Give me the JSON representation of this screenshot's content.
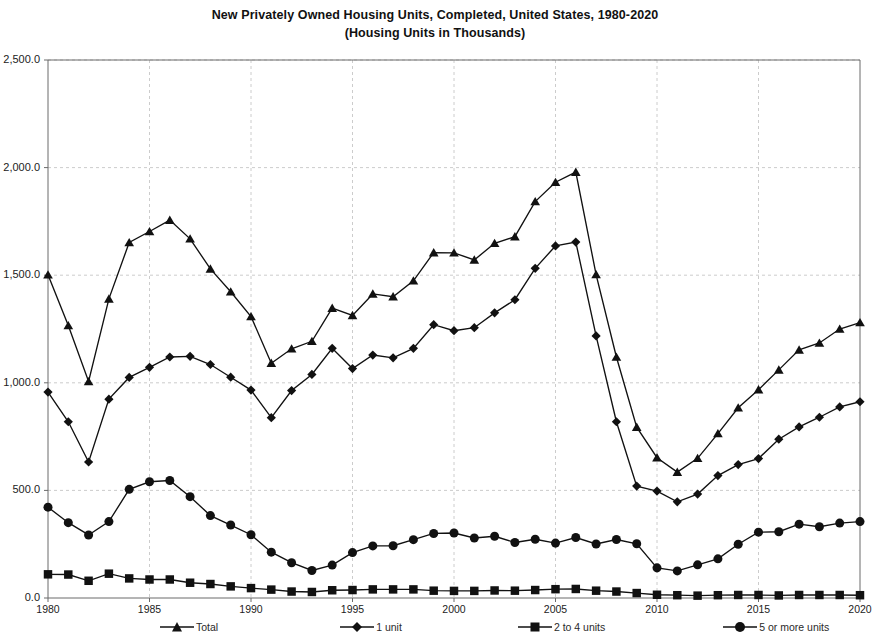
{
  "chart_data": {
    "type": "line",
    "title": "New Privately Owned Housing Units, Completed, United States, 1980-2020",
    "subtitle": "(Housing Units in Thousands)",
    "xlabel": "",
    "ylabel": "",
    "xlim": [
      1980,
      2020
    ],
    "ylim": [
      0,
      2500
    ],
    "grid": true,
    "legend_position": "bottom",
    "ytick_labels": [
      "2,500.0",
      "2,000.0",
      "1,500.0",
      "1,000.0",
      "500.0",
      "0.0"
    ],
    "ytick_values": [
      2500,
      2000,
      1500,
      1000,
      500,
      0
    ],
    "xtick_labels": [
      "1980",
      "1985",
      "1990",
      "1995",
      "2000",
      "2005",
      "2010",
      "2015",
      "2020"
    ],
    "xtick_values": [
      1980,
      1985,
      1990,
      1995,
      2000,
      2005,
      2010,
      2015,
      2020
    ],
    "x": [
      1980,
      1981,
      1982,
      1983,
      1984,
      1985,
      1986,
      1987,
      1988,
      1989,
      1990,
      1991,
      1992,
      1993,
      1994,
      1995,
      1996,
      1997,
      1998,
      1999,
      2000,
      2001,
      2002,
      2003,
      2004,
      2005,
      2006,
      2007,
      2008,
      2009,
      2010,
      2011,
      2012,
      2013,
      2014,
      2015,
      2016,
      2017,
      2018,
      2019,
      2020
    ],
    "series": [
      {
        "name": "Total",
        "marker": "triangle",
        "values": [
          1502,
          1266,
          1006,
          1390,
          1652,
          1703,
          1756,
          1669,
          1529,
          1423,
          1308,
          1091,
          1158,
          1193,
          1347,
          1313,
          1413,
          1400,
          1474,
          1605,
          1604,
          1571,
          1648,
          1679,
          1842,
          1932,
          1979,
          1503,
          1120,
          794,
          652,
          585,
          649,
          764,
          884,
          968,
          1060,
          1153,
          1185,
          1250,
          1280
        ]
      },
      {
        "name": "1 unit",
        "marker": "diamond",
        "values": [
          957,
          819,
          632,
          924,
          1025,
          1072,
          1120,
          1123,
          1085,
          1026,
          966,
          838,
          964,
          1039,
          1160,
          1066,
          1129,
          1116,
          1160,
          1270,
          1242,
          1256,
          1325,
          1386,
          1532,
          1636,
          1654,
          1218,
          819,
          520,
          497,
          447,
          483,
          569,
          620,
          648,
          738,
          795,
          840,
          888,
          912
        ]
      },
      {
        "name": "2 to 4 units",
        "marker": "square",
        "values": [
          110,
          109,
          80,
          113,
          91,
          86,
          86,
          71,
          65,
          54,
          46,
          39,
          30,
          28,
          36,
          37,
          40,
          40,
          40,
          34,
          33,
          33,
          35,
          34,
          37,
          41,
          42,
          34,
          30,
          23,
          15,
          13,
          11,
          13,
          14,
          14,
          12,
          14,
          14,
          14,
          13
        ]
      },
      {
        "name": "5 or more units",
        "marker": "circle",
        "values": [
          422,
          350,
          293,
          355,
          505,
          540,
          546,
          471,
          383,
          339,
          294,
          213,
          164,
          128,
          153,
          211,
          242,
          243,
          271,
          300,
          302,
          279,
          287,
          258,
          273,
          255,
          281,
          251,
          272,
          252,
          140,
          126,
          154,
          182,
          250,
          306,
          308,
          343,
          331,
          348,
          355
        ]
      }
    ]
  },
  "legend": {
    "items": [
      {
        "label": "Total",
        "marker": "triangle-marker-icon"
      },
      {
        "label": "1 unit",
        "marker": "diamond-marker-icon"
      },
      {
        "label": "2 to 4 units",
        "marker": "square-marker-icon"
      },
      {
        "label": "5 or more units",
        "marker": "circle-marker-icon"
      }
    ]
  }
}
